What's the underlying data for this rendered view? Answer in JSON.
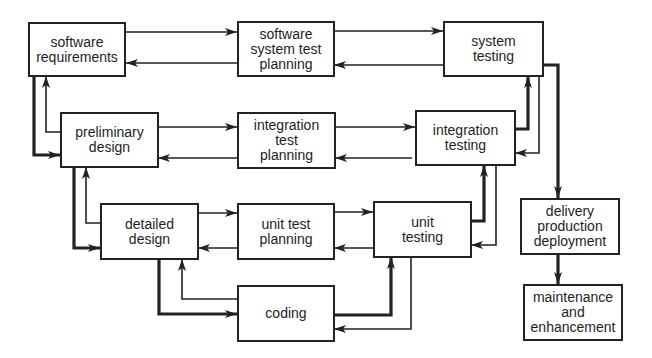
{
  "diagram": {
    "type": "V-model software development lifecycle",
    "colors": {
      "stroke": "#222222",
      "text": "#1e1e1e",
      "background": "#ffffff"
    },
    "nodes": [
      {
        "id": "sw_req",
        "label": "software\nrequirements"
      },
      {
        "id": "sst_plan",
        "label": "software\nsystem test\nplanning"
      },
      {
        "id": "sys_test",
        "label": "system\ntesting"
      },
      {
        "id": "pre_des",
        "label": "preliminary\ndesign"
      },
      {
        "id": "int_plan",
        "label": "integration\ntest\nplanning"
      },
      {
        "id": "int_test",
        "label": "integration\ntesting"
      },
      {
        "id": "det_des",
        "label": "detailed\ndesign"
      },
      {
        "id": "ut_plan",
        "label": "unit test\nplanning"
      },
      {
        "id": "ut_test",
        "label": "unit\ntesting"
      },
      {
        "id": "coding",
        "label": "coding"
      },
      {
        "id": "delivery",
        "label": "delivery\nproduction\ndeployment"
      },
      {
        "id": "maint",
        "label": "maintenance\nand\nenhancement"
      }
    ],
    "edges": [
      {
        "from": "sw_req",
        "to": "sst_plan",
        "weight": "thin"
      },
      {
        "from": "sst_plan",
        "to": "sw_req",
        "weight": "thin"
      },
      {
        "from": "sst_plan",
        "to": "sys_test",
        "weight": "thin"
      },
      {
        "from": "sys_test",
        "to": "sst_plan",
        "weight": "thin"
      },
      {
        "from": "sw_req",
        "to": "pre_des",
        "weight": "thick"
      },
      {
        "from": "pre_des",
        "to": "sw_req",
        "weight": "thin"
      },
      {
        "from": "pre_des",
        "to": "int_plan",
        "weight": "thin"
      },
      {
        "from": "int_plan",
        "to": "pre_des",
        "weight": "thin"
      },
      {
        "from": "int_plan",
        "to": "int_test",
        "weight": "thin"
      },
      {
        "from": "int_test",
        "to": "int_plan",
        "weight": "thin"
      },
      {
        "from": "int_test",
        "to": "sys_test",
        "weight": "thick"
      },
      {
        "from": "sys_test",
        "to": "int_test",
        "weight": "thin"
      },
      {
        "from": "pre_des",
        "to": "det_des",
        "weight": "thick"
      },
      {
        "from": "det_des",
        "to": "pre_des",
        "weight": "thin"
      },
      {
        "from": "det_des",
        "to": "ut_plan",
        "weight": "thin"
      },
      {
        "from": "ut_plan",
        "to": "det_des",
        "weight": "thin"
      },
      {
        "from": "ut_plan",
        "to": "ut_test",
        "weight": "thin"
      },
      {
        "from": "ut_test",
        "to": "ut_plan",
        "weight": "thin"
      },
      {
        "from": "ut_test",
        "to": "int_test",
        "weight": "thick"
      },
      {
        "from": "int_test",
        "to": "ut_test",
        "weight": "thin"
      },
      {
        "from": "det_des",
        "to": "coding",
        "weight": "thick"
      },
      {
        "from": "coding",
        "to": "det_des",
        "weight": "thin"
      },
      {
        "from": "coding",
        "to": "ut_test",
        "weight": "thick"
      },
      {
        "from": "ut_test",
        "to": "coding",
        "weight": "thin"
      },
      {
        "from": "sys_test",
        "to": "delivery",
        "weight": "thick"
      },
      {
        "from": "delivery",
        "to": "maint",
        "weight": "thick"
      }
    ]
  }
}
